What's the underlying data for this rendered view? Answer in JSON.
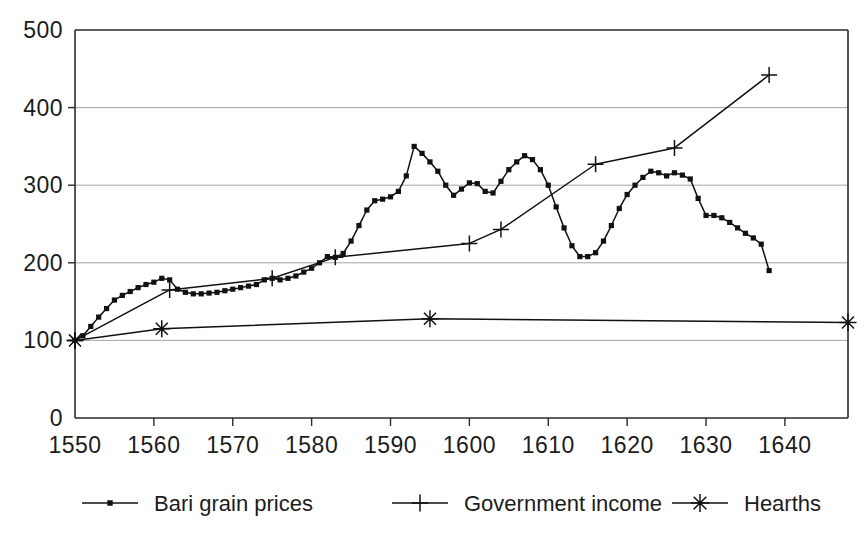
{
  "chart_data": {
    "type": "line",
    "title": "",
    "xlabel": "",
    "ylabel": "",
    "xlim": [
      1550,
      1648
    ],
    "ylim": [
      0,
      500
    ],
    "yticks": [
      0,
      100,
      200,
      300,
      400,
      500
    ],
    "xticks": [
      1550,
      1560,
      1570,
      1580,
      1590,
      1600,
      1610,
      1620,
      1630,
      1640
    ],
    "grid": "horizontal",
    "legend_position": "bottom",
    "index_base": 100,
    "series": [
      {
        "name": "Bari grain prices",
        "marker": "dot",
        "x": [
          1550,
          1551,
          1552,
          1553,
          1554,
          1555,
          1556,
          1557,
          1558,
          1559,
          1560,
          1561,
          1562,
          1563,
          1564,
          1565,
          1566,
          1567,
          1568,
          1569,
          1570,
          1571,
          1572,
          1573,
          1574,
          1575,
          1576,
          1577,
          1578,
          1579,
          1580,
          1581,
          1582,
          1583,
          1584,
          1585,
          1586,
          1587,
          1588,
          1589,
          1590,
          1591,
          1592,
          1593,
          1594,
          1595,
          1596,
          1597,
          1598,
          1599,
          1600,
          1601,
          1602,
          1603,
          1604,
          1605,
          1606,
          1607,
          1608,
          1609,
          1610,
          1611,
          1612,
          1613,
          1614,
          1615,
          1616,
          1617,
          1618,
          1619,
          1620,
          1621,
          1622,
          1623,
          1624,
          1625,
          1626,
          1627,
          1628,
          1629,
          1630,
          1631,
          1632,
          1633,
          1634,
          1635,
          1636,
          1637,
          1638
        ],
        "values": [
          100,
          106,
          118,
          130,
          141,
          152,
          158,
          163,
          168,
          172,
          175,
          180,
          178,
          166,
          162,
          160,
          160,
          161,
          162,
          164,
          166,
          168,
          170,
          172,
          178,
          180,
          178,
          180,
          183,
          188,
          193,
          200,
          208,
          207,
          212,
          228,
          248,
          268,
          280,
          282,
          285,
          292,
          312,
          350,
          341,
          330,
          318,
          300,
          287,
          295,
          303,
          302,
          292,
          290,
          305,
          320,
          330,
          338,
          333,
          320,
          300,
          272,
          245,
          222,
          208,
          208,
          213,
          228,
          248,
          270,
          288,
          300,
          310,
          318,
          316,
          312,
          316,
          313,
          308,
          283,
          261,
          261,
          258,
          252,
          245,
          238,
          232,
          224,
          190
        ]
      },
      {
        "name": "Government income",
        "marker": "plus",
        "x": [
          1550,
          1562,
          1575,
          1583,
          1600,
          1604,
          1616,
          1626,
          1638
        ],
        "values": [
          100,
          165,
          180,
          207,
          225,
          243,
          327,
          348,
          442
        ]
      },
      {
        "name": "Hearths",
        "marker": "asterisk",
        "x": [
          1550,
          1561,
          1595,
          1648
        ],
        "values": [
          100,
          115,
          128,
          123
        ]
      }
    ]
  },
  "legend": {
    "items": [
      {
        "label": "Bari grain prices",
        "marker": "dot"
      },
      {
        "label": "Government income",
        "marker": "plus"
      },
      {
        "label": "Hearths",
        "marker": "asterisk"
      }
    ]
  },
  "colors": {
    "ink": "#111111",
    "axis": "#2b2b2b",
    "grid": "#9b9b9b",
    "background": "#ffffff"
  }
}
